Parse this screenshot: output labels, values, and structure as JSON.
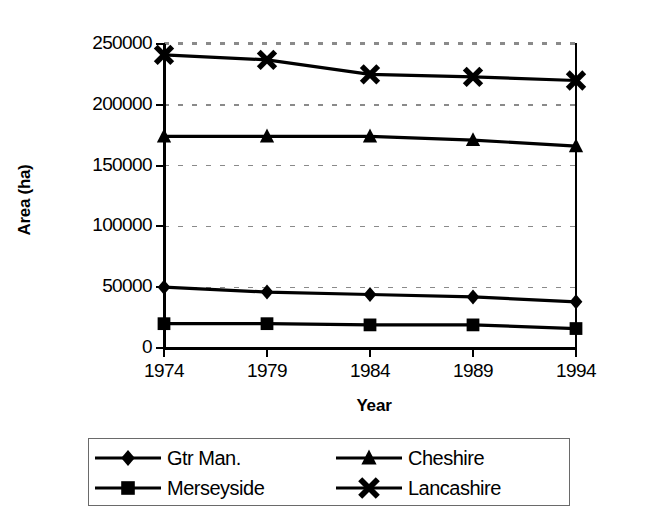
{
  "chart_data": {
    "type": "line",
    "title": "",
    "xlabel": "Year",
    "ylabel": "Area (ha)",
    "categories": [
      "1974",
      "1979",
      "1984",
      "1989",
      "1994"
    ],
    "x": [
      1974,
      1979,
      1984,
      1989,
      1994
    ],
    "xlim": [
      1974,
      1994
    ],
    "ylim": [
      0,
      250000
    ],
    "y_ticks": [
      "0",
      "50000",
      "100000",
      "150000",
      "200000",
      "250000"
    ],
    "y_tick_values": [
      0,
      50000,
      100000,
      150000,
      200000,
      250000
    ],
    "x_ticks": [
      "1974",
      "1979",
      "1984",
      "1989",
      "1994"
    ],
    "grid": "horizontal-dashed",
    "legend_position": "below-chart",
    "series": [
      {
        "name": "Gtr Man.",
        "marker": "diamond",
        "color": "#000000",
        "values": [
          50000,
          46000,
          44000,
          42000,
          38000
        ]
      },
      {
        "name": "Cheshire",
        "marker": "triangle",
        "color": "#000000",
        "values": [
          174000,
          174000,
          174000,
          171000,
          166000
        ]
      },
      {
        "name": "Merseyside",
        "marker": "square",
        "color": "#000000",
        "values": [
          20000,
          20000,
          19000,
          19000,
          16000
        ]
      },
      {
        "name": "Lancashire",
        "marker": "cross-x",
        "color": "#000000",
        "values": [
          241000,
          237000,
          225000,
          223000,
          220000
        ]
      }
    ]
  },
  "axes": {
    "y_title": "Area (ha)",
    "x_title": "Year",
    "y_labels": [
      "250000",
      "200000",
      "150000",
      "100000",
      "50000",
      "0"
    ],
    "x_labels": [
      "1974",
      "1979",
      "1984",
      "1989",
      "1994"
    ]
  },
  "legend": {
    "entries": [
      {
        "label": "Gtr Man.",
        "marker": "diamond"
      },
      {
        "label": "Cheshire",
        "marker": "triangle"
      },
      {
        "label": "Merseyside",
        "marker": "square"
      },
      {
        "label": "Lancashire",
        "marker": "cross-x"
      }
    ]
  },
  "colors": {
    "line": "#000000",
    "grid": "#8a8a8a",
    "frame": "#000000",
    "background": "#ffffff",
    "legend_border": "#6a6a6a"
  }
}
